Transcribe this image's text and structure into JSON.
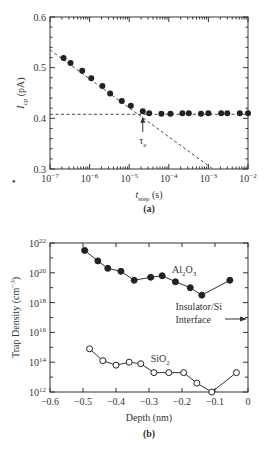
{
  "chart_data": [
    {
      "type": "scatter",
      "panel_label": "(a)",
      "xscale": "log",
      "xlim": [
        1e-07,
        0.01
      ],
      "ylim": [
        0.3,
        0.6
      ],
      "xlabel_main": "t",
      "xlabel_sub": "step",
      "xlabel_unit": " (s)",
      "ylabel_main": "I",
      "ylabel_sub": "cp",
      "ylabel_unit": " (pA)",
      "xticks": [
        {
          "exp": -7,
          "label": "10",
          "sup": "−7"
        },
        {
          "exp": -6,
          "label": "10",
          "sup": "−6"
        },
        {
          "exp": -5,
          "label": "10",
          "sup": "−5"
        },
        {
          "exp": -4,
          "label": "10",
          "sup": "−4"
        },
        {
          "exp": -3,
          "label": "10",
          "sup": "−3"
        },
        {
          "exp": -2,
          "label": "10",
          "sup": "−2"
        }
      ],
      "yticks": [
        {
          "value": 0.3,
          "label": "0.3"
        },
        {
          "value": 0.4,
          "label": "0.4"
        },
        {
          "value": 0.5,
          "label": "0.5"
        },
        {
          "value": 0.6,
          "label": "0.6"
        }
      ],
      "grid": false,
      "series": [
        {
          "name": "Icp",
          "marker": "filled-circle",
          "x": [
            2.2e-07,
            3.3e-07,
            6.5e-07,
            1.1e-06,
            2.1e-06,
            3.3e-06,
            6.5e-06,
            1.1e-05,
            2.2e-05,
            3.2e-05,
            6.5e-05,
            0.00011,
            0.00022,
            0.00032,
            0.00065,
            0.001,
            0.0021,
            0.003,
            0.0062,
            0.01
          ],
          "y": [
            0.519,
            0.509,
            0.494,
            0.479,
            0.464,
            0.449,
            0.434,
            0.425,
            0.414,
            0.41,
            0.409,
            0.409,
            0.41,
            0.41,
            0.409,
            0.41,
            0.41,
            0.41,
            0.41,
            0.41
          ]
        }
      ],
      "reference_lines": [
        {
          "name": "saturation-line",
          "style": "dashed",
          "x": [
            1e-07,
            0.01
          ],
          "y": [
            0.408,
            0.408
          ]
        },
        {
          "name": "logarithmic-fit-line",
          "style": "dashed",
          "x": [
            1e-07,
            0.0013
          ],
          "y": [
            0.535,
            0.3
          ]
        }
      ],
      "annotations": [
        {
          "text": "τ",
          "sub": "e",
          "x": 2.2e-05,
          "y": 0.355,
          "arrow_to_y": 0.405
        }
      ]
    },
    {
      "type": "line",
      "panel_label": "(b)",
      "yscale": "log",
      "xlim": [
        -0.6,
        0
      ],
      "ylim": [
        1000000000000.0,
        1e+22
      ],
      "xlabel": "Depth (nm)",
      "ylabel_main": "Trap Density (cm",
      "ylabel_sup": "−3",
      "ylabel_end": ")",
      "xticks": [
        {
          "value": -0.6,
          "label": "−0.6"
        },
        {
          "value": -0.5,
          "label": "−0.5"
        },
        {
          "value": -0.4,
          "label": "−0.4"
        },
        {
          "value": -0.3,
          "label": "−0.3"
        },
        {
          "value": -0.2,
          "label": "−0.2"
        },
        {
          "value": -0.1,
          "label": "−0.1"
        },
        {
          "value": 0,
          "label": "0"
        }
      ],
      "yticks": [
        {
          "exp": 12,
          "label": "10",
          "sup": "12"
        },
        {
          "exp": 14,
          "label": "10",
          "sup": "14"
        },
        {
          "exp": 16,
          "label": "10",
          "sup": "16"
        },
        {
          "exp": 18,
          "label": "10",
          "sup": "18"
        },
        {
          "exp": 20,
          "label": "10",
          "sup": "20"
        },
        {
          "exp": 22,
          "label": "10",
          "sup": "22"
        }
      ],
      "grid": false,
      "series": [
        {
          "name": "Al2O3",
          "label_main": "Al",
          "label_sub1": "2",
          "label_mid": "O",
          "label_sub2": "3",
          "marker": "filled-circle",
          "x": [
            -0.495,
            -0.455,
            -0.425,
            -0.385,
            -0.345,
            -0.295,
            -0.26,
            -0.22,
            -0.175,
            -0.14,
            -0.055
          ],
          "log10y": [
            21.5,
            20.8,
            20.3,
            20.1,
            19.5,
            19.7,
            19.8,
            19.4,
            19.0,
            18.5,
            19.5
          ]
        },
        {
          "name": "SiO2",
          "label_main": "SiO",
          "label_sub1": "2",
          "marker": "open-circle",
          "x": [
            -0.48,
            -0.44,
            -0.4,
            -0.36,
            -0.325,
            -0.285,
            -0.24,
            -0.195,
            -0.155,
            -0.11,
            -0.035
          ],
          "log10y": [
            14.9,
            14.1,
            13.8,
            14.0,
            13.9,
            13.3,
            13.3,
            13.3,
            12.6,
            12.0,
            13.3
          ]
        }
      ],
      "annotations": [
        {
          "text_line1": "Insulator/Si",
          "text_line2": "Interface",
          "arrow_x": 0,
          "arrow_log10y": 16.9
        }
      ]
    }
  ],
  "page": {
    "stray_mark": "•"
  }
}
